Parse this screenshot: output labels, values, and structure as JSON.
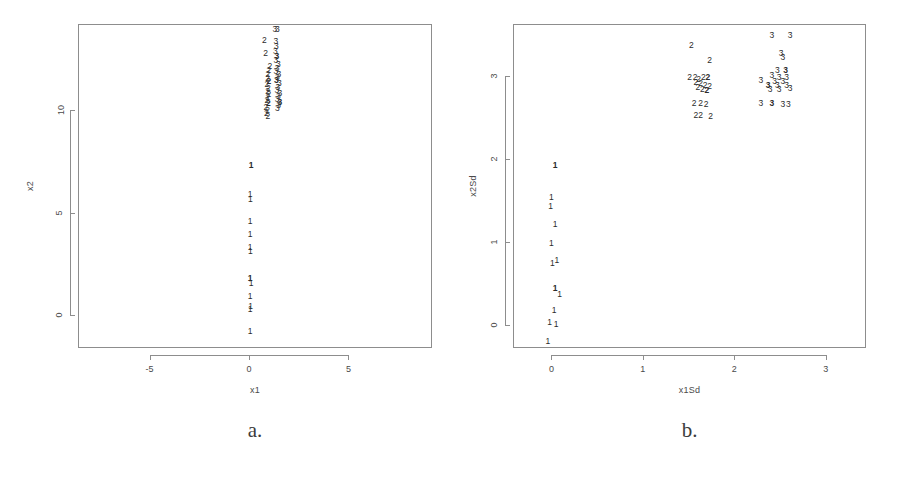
{
  "figure": {
    "background": "#ffffff",
    "foreground": "#3a3a3a",
    "frame_color": "#8d8d8d"
  },
  "panels": [
    {
      "id": "a",
      "caption": "a.",
      "chart_data": {
        "type": "scatter",
        "title": "",
        "xlabel": "x1",
        "ylabel": "x2",
        "xlim": [
          -8.6,
          9.2
        ],
        "ylim": [
          -1.6,
          14.2
        ],
        "xticks": [
          -5,
          0,
          5
        ],
        "xtick_labels": [
          "-5",
          "0",
          "5"
        ],
        "yticks": [
          0,
          5,
          10
        ],
        "ytick_labels": [
          "0",
          "5",
          "10"
        ],
        "grid": false,
        "legend": "none",
        "point_marker": "cluster-number-label",
        "series": [
          {
            "name": "1",
            "label": "1",
            "points": [
              [
                0.05,
                7.35
              ],
              [
                0.0,
                5.95
              ],
              [
                0.02,
                5.72
              ],
              [
                0.0,
                4.62
              ],
              [
                0.0,
                4.02
              ],
              [
                0.0,
                3.35
              ],
              [
                0.02,
                3.2
              ],
              [
                0.0,
                1.85
              ],
              [
                0.05,
                1.62
              ],
              [
                0.0,
                1.0
              ],
              [
                0.03,
                0.48
              ],
              [
                0.0,
                0.35
              ],
              [
                0.0,
                -0.72
              ]
            ]
          },
          {
            "name": "2",
            "label": "2",
            "points": [
              [
                0.72,
                13.45
              ],
              [
                0.78,
                12.85
              ],
              [
                1.0,
                12.2
              ],
              [
                0.95,
                12.0
              ],
              [
                0.9,
                11.8
              ],
              [
                0.88,
                11.6
              ],
              [
                0.95,
                11.45
              ],
              [
                0.85,
                11.3
              ],
              [
                0.92,
                11.15
              ],
              [
                0.88,
                11.0
              ],
              [
                0.95,
                10.85
              ],
              [
                0.9,
                10.7
              ],
              [
                0.85,
                10.55
              ],
              [
                0.92,
                10.4
              ],
              [
                0.8,
                10.2
              ],
              [
                0.88,
                10.05
              ],
              [
                0.82,
                9.9
              ],
              [
                0.9,
                9.75
              ]
            ]
          },
          {
            "name": "3",
            "label": "3",
            "points": [
              [
                1.25,
                14.0
              ],
              [
                1.38,
                14.0
              ],
              [
                1.3,
                13.4
              ],
              [
                1.32,
                13.2
              ],
              [
                1.28,
                12.95
              ],
              [
                1.35,
                12.7
              ],
              [
                1.3,
                12.5
              ],
              [
                1.42,
                12.3
              ],
              [
                1.36,
                12.1
              ],
              [
                1.3,
                11.95
              ],
              [
                1.45,
                11.8
              ],
              [
                1.38,
                11.65
              ],
              [
                1.32,
                11.5
              ],
              [
                1.48,
                11.35
              ],
              [
                1.4,
                11.2
              ],
              [
                1.35,
                11.05
              ],
              [
                1.5,
                10.9
              ],
              [
                1.42,
                10.75
              ],
              [
                1.36,
                10.6
              ],
              [
                1.5,
                10.45
              ],
              [
                1.44,
                10.3
              ],
              [
                1.38,
                10.15
              ]
            ]
          }
        ]
      }
    },
    {
      "id": "b",
      "caption": "b.",
      "chart_data": {
        "type": "scatter",
        "title": "",
        "xlabel": "x1Sd",
        "ylabel": "x2Sd",
        "xlim": [
          -0.42,
          3.44
        ],
        "ylim": [
          -0.28,
          3.62
        ],
        "xticks": [
          0,
          1,
          2,
          3
        ],
        "xtick_labels": [
          "0",
          "1",
          "2",
          "3"
        ],
        "yticks": [
          0,
          1,
          2,
          3
        ],
        "ytick_labels": [
          "0",
          "1",
          "2",
          "3"
        ],
        "grid": false,
        "legend": "none",
        "point_marker": "cluster-number-label",
        "series": [
          {
            "name": "1",
            "label": "1",
            "points": [
              [
                0.03,
                1.93
              ],
              [
                -0.01,
                1.55
              ],
              [
                -0.02,
                1.44
              ],
              [
                0.03,
                1.22
              ],
              [
                -0.01,
                1.0
              ],
              [
                0.0,
                0.76
              ],
              [
                0.05,
                0.79
              ],
              [
                0.03,
                0.45
              ],
              [
                0.08,
                0.38
              ],
              [
                0.02,
                0.19
              ],
              [
                -0.03,
                0.04
              ],
              [
                0.04,
                0.02
              ],
              [
                -0.05,
                -0.18
              ]
            ]
          },
          {
            "name": "2",
            "label": "2",
            "points": [
              [
                1.52,
                3.38
              ],
              [
                1.72,
                3.2
              ],
              [
                1.5,
                3.0
              ],
              [
                1.56,
                2.99
              ],
              [
                1.6,
                2.97
              ],
              [
                1.65,
                2.99
              ],
              [
                1.7,
                3.0
              ],
              [
                1.57,
                2.93
              ],
              [
                1.62,
                2.92
              ],
              [
                1.67,
                2.9
              ],
              [
                1.72,
                2.88
              ],
              [
                1.59,
                2.87
              ],
              [
                1.64,
                2.85
              ],
              [
                1.69,
                2.84
              ],
              [
                1.55,
                2.68
              ],
              [
                1.62,
                2.68
              ],
              [
                1.68,
                2.67
              ],
              [
                1.57,
                2.54
              ],
              [
                1.62,
                2.54
              ],
              [
                1.73,
                2.52
              ]
            ]
          },
          {
            "name": "3",
            "label": "3",
            "points": [
              [
                2.4,
                3.5
              ],
              [
                2.6,
                3.5
              ],
              [
                2.5,
                3.28
              ],
              [
                2.52,
                3.24
              ],
              [
                2.46,
                3.08
              ],
              [
                2.55,
                3.08
              ],
              [
                2.4,
                3.02
              ],
              [
                2.48,
                3.0
              ],
              [
                2.56,
                3.0
              ],
              [
                2.28,
                2.96
              ],
              [
                2.43,
                2.95
              ],
              [
                2.52,
                2.95
              ],
              [
                2.36,
                2.9
              ],
              [
                2.46,
                2.9
              ],
              [
                2.56,
                2.9
              ],
              [
                2.38,
                2.85
              ],
              [
                2.48,
                2.85
              ],
              [
                2.6,
                2.86
              ],
              [
                2.28,
                2.68
              ],
              [
                2.4,
                2.68
              ],
              [
                2.52,
                2.67
              ],
              [
                2.58,
                2.67
              ]
            ]
          }
        ]
      }
    }
  ]
}
